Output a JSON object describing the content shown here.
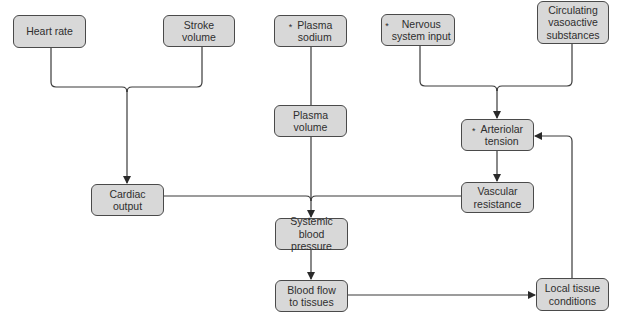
{
  "nodes": {
    "heart_rate": {
      "label": "Heart rate",
      "starred": false
    },
    "stroke_volume": {
      "label": "Stroke\nvolume",
      "starred": false
    },
    "plasma_sodium": {
      "label": "Plasma\nsodium",
      "starred": true
    },
    "nervous_system_input": {
      "label": "Nervous\nsystem input",
      "starred": true
    },
    "circulating_vasoactive": {
      "label": "Circulating\nvasoactive\nsubstances",
      "starred": false
    },
    "plasma_volume": {
      "label": "Plasma\nvolume",
      "starred": false
    },
    "arteriolar_tension": {
      "label": "Arteriolar\ntension",
      "starred": true
    },
    "cardiac_output": {
      "label": "Cardiac\noutput",
      "starred": false
    },
    "vascular_resistance": {
      "label": "Vascular\nresistance",
      "starred": false
    },
    "systemic_blood_pressure": {
      "label": "Systemic blood\npressure",
      "starred": false
    },
    "blood_flow_to_tissues": {
      "label": "Blood flow\nto tissues",
      "starred": false
    },
    "local_tissue_conditions": {
      "label": "Local tissue\nconditions",
      "starred": false
    }
  },
  "star_symbol": "*",
  "edges": [
    {
      "from": [
        "heart_rate",
        "stroke_volume"
      ],
      "to": "cardiac_output"
    },
    {
      "from": [
        "plasma_sodium"
      ],
      "to": "plasma_volume"
    },
    {
      "from": [
        "nervous_system_input",
        "circulating_vasoactive"
      ],
      "to": "arteriolar_tension"
    },
    {
      "from": [
        "arteriolar_tension"
      ],
      "to": "vascular_resistance"
    },
    {
      "from": [
        "plasma_volume",
        "cardiac_output",
        "vascular_resistance"
      ],
      "to": "systemic_blood_pressure"
    },
    {
      "from": [
        "systemic_blood_pressure"
      ],
      "to": "blood_flow_to_tissues"
    },
    {
      "from": [
        "blood_flow_to_tissues"
      ],
      "to": "local_tissue_conditions"
    },
    {
      "from": [
        "local_tissue_conditions"
      ],
      "to": "arteriolar_tension"
    }
  ],
  "colors": {
    "node_fill": "#d8d8d8",
    "node_border": "#4a4a4a",
    "line": "#3a3a3a",
    "text": "#2e2e2e"
  }
}
